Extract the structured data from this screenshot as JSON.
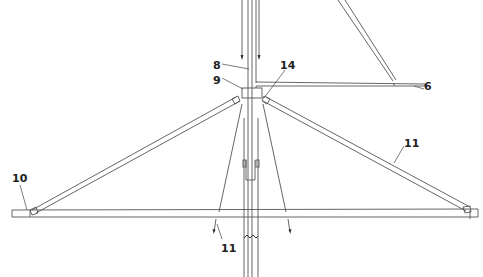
{
  "figure": {
    "type": "patent line drawing",
    "line_color": "#555555",
    "background": "#ffffff"
  },
  "labels": [
    {
      "id": "label-6",
      "text": "6",
      "x": 424,
      "y": 81
    },
    {
      "id": "label-8",
      "text": "8",
      "x": 213,
      "y": 60
    },
    {
      "id": "label-9",
      "text": "9",
      "x": 213,
      "y": 75
    },
    {
      "id": "label-14",
      "text": "14",
      "x": 280,
      "y": 60
    },
    {
      "id": "label-10",
      "text": "10",
      "x": 12,
      "y": 173
    },
    {
      "id": "label-11-right",
      "text": "11",
      "x": 404,
      "y": 138
    },
    {
      "id": "label-11-bottom",
      "text": "11",
      "x": 221,
      "y": 243
    }
  ]
}
